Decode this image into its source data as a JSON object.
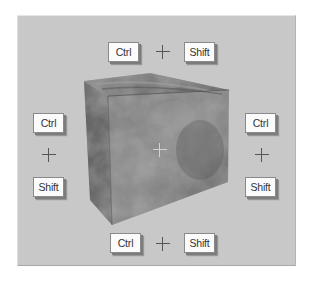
{
  "diagram": {
    "background_color": "#c8c8c8",
    "key_face_color": "#fbfbfb",
    "plus_symbol": "+",
    "top": {
      "keys": [
        {
          "label": "Ctrl"
        },
        {
          "label": "Shift"
        }
      ]
    },
    "left": {
      "keys": [
        {
          "label": "Ctrl"
        },
        {
          "label": "Shift"
        }
      ]
    },
    "right": {
      "keys": [
        {
          "label": "Ctrl"
        },
        {
          "label": "Shift"
        }
      ]
    },
    "bottom": {
      "keys": [
        {
          "label": "Ctrl"
        },
        {
          "label": "Shift"
        }
      ]
    },
    "cube": {
      "texture": "marbled-rock",
      "center_marker": "crosshair"
    }
  }
}
